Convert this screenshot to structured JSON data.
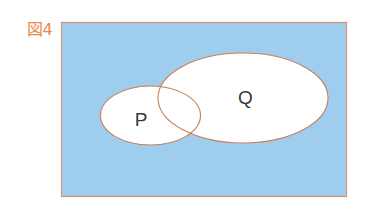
{
  "figure": {
    "label": "図4"
  },
  "colors": {
    "label": "#e8894f",
    "universe_fill": "#9fcdee",
    "universe_stroke": "#d8926c",
    "set_fill": "#ffffff",
    "set_stroke": "#c9805a",
    "set_label_text": "#3a3a3a"
  },
  "universe": {
    "x": 61,
    "y": 22,
    "width": 285,
    "height": 174
  },
  "sets": [
    {
      "name": "P",
      "label": "P",
      "cx": 150.5,
      "cy": 115.5,
      "rx": 50,
      "ry": 29.5,
      "label_x": 141,
      "label_y": 126
    },
    {
      "name": "Q",
      "label": "Q",
      "cx": 243,
      "cy": 98,
      "rx": 85,
      "ry": 45,
      "label_x": 245.5,
      "label_y": 104
    }
  ]
}
